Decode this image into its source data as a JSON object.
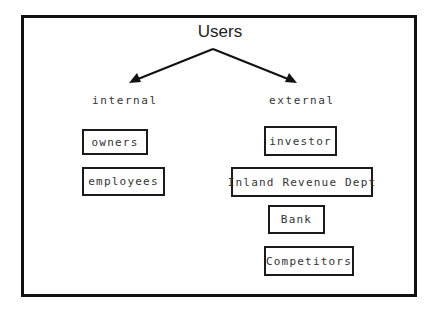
{
  "diagram": {
    "title": "Users",
    "categories": {
      "internal": {
        "label": "internal",
        "items": [
          "owners",
          "employees"
        ]
      },
      "external": {
        "label": "external",
        "items": [
          "investor",
          "Inland Revenue Dept",
          "Bank",
          "Competitors"
        ]
      }
    },
    "colors": {
      "border": "#111111",
      "text": "#333333",
      "background": "#ffffff"
    }
  }
}
